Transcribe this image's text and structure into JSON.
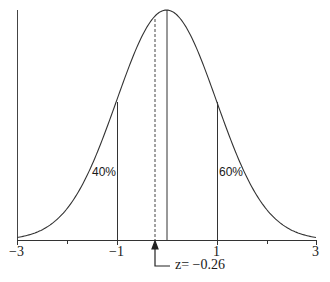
{
  "diagram": {
    "type": "normal-distribution-curve",
    "axis": {
      "min": -3,
      "max": 3,
      "tick_labels": [
        {
          "value": -3,
          "label": "−3"
        },
        {
          "value": -1,
          "label": "−1"
        },
        {
          "value": 1,
          "label": "1"
        },
        {
          "value": 3,
          "label": "3"
        }
      ],
      "minor_ticks": [
        -2,
        2
      ]
    },
    "regions": [
      {
        "label": "40%",
        "side": "left"
      },
      {
        "label": "60%",
        "side": "right"
      }
    ],
    "marker": {
      "z_value": -0.26,
      "label": "z= −0.26",
      "style": "dashed"
    },
    "colors": {
      "line": "#333333",
      "text": "#1a1a1a",
      "background": "#ffffff"
    }
  }
}
